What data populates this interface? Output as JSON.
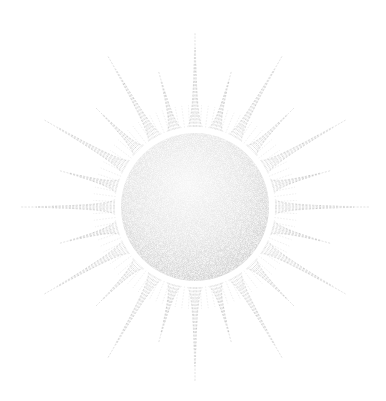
{
  "image": {
    "subject": "sun illustration",
    "style": "stippled pencil drawing",
    "background_color": "#ffffff",
    "ink_color": "#9a9a9a"
  },
  "sun": {
    "center": [
      195,
      207
    ],
    "disc_radius": 74,
    "ring_gap": 6,
    "ray_count": 24,
    "ray_long": 175,
    "ray_short": 140,
    "ray_half_width_deg": 5.5
  },
  "caption": "Sun"
}
